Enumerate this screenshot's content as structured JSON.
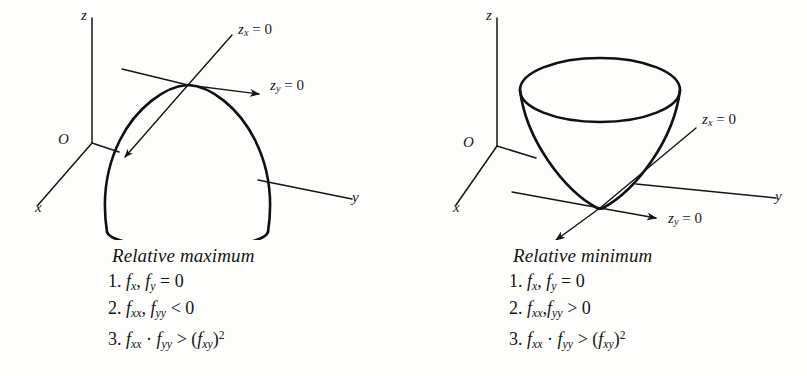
{
  "figure_left": {
    "name": "relative-maximum-figure",
    "axes": {
      "z_label": "z",
      "x_label": "x",
      "y_label": "y",
      "origin_label": "O"
    },
    "annotations": {
      "zx": "z",
      "zx_sub": "x",
      "zx_eq": " = 0",
      "zy": "z",
      "zy_sub": "y",
      "zy_eq": " = 0"
    },
    "surface": "dome",
    "caption": {
      "title": "Relative maximum",
      "items": [
        {
          "n": "1.",
          "expr": "f_x, f_y = 0"
        },
        {
          "n": "2.",
          "expr": "f_xx, f_yy < 0"
        },
        {
          "n": "3.",
          "expr": "f_xx · f_yy > (f_xy)^2"
        }
      ]
    }
  },
  "figure_right": {
    "name": "relative-minimum-figure",
    "axes": {
      "z_label": "z",
      "x_label": "x",
      "y_label": "y",
      "origin_label": "O"
    },
    "annotations": {
      "zx": "z",
      "zx_sub": "x",
      "zx_eq": " = 0",
      "zy": "z",
      "zy_sub": "y",
      "zy_eq": " = 0"
    },
    "surface": "bowl",
    "caption": {
      "title": "Relative minimum",
      "items": [
        {
          "n": "1.",
          "expr": "f_x, f_y = 0"
        },
        {
          "n": "2.",
          "expr": "f_xx, f_yy > 0"
        },
        {
          "n": "3.",
          "expr": "f_xx · f_yy > (f_xy)^2"
        }
      ]
    }
  },
  "symbols": {
    "f": "f",
    "comma": ",",
    "eq_zero": " = 0",
    "lt_zero": " < 0",
    "gt_zero": " > 0",
    "dot": " · ",
    "gt": " > ",
    "sub_x": "x",
    "sub_y": "y",
    "sub_xx": "xx",
    "sub_yy": "yy",
    "sub_xy": "xy",
    "sup_two": "2",
    "paren_open": "(",
    "paren_close": ")",
    "item1": "1.",
    "item2": "2.",
    "item3": "3."
  },
  "colors": {
    "ink": "#1a1a1a",
    "paper": "#fdfdfb",
    "curve": "#111111"
  }
}
